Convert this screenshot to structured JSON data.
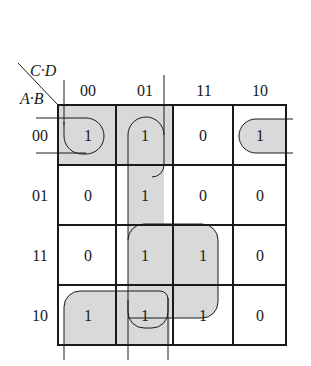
{
  "axis": {
    "column_variables": "C·D",
    "row_variables": "A·B"
  },
  "columns": [
    "00",
    "01",
    "11",
    "10"
  ],
  "rows": [
    "00",
    "01",
    "11",
    "10"
  ],
  "cells": [
    [
      "1",
      "1",
      "0",
      "1"
    ],
    [
      "0",
      "1",
      "0",
      "0"
    ],
    [
      "0",
      "1",
      "1",
      "0"
    ],
    [
      "1",
      "1",
      "1",
      "0"
    ]
  ],
  "groupings": [
    {
      "name": "row-00 wrap group",
      "cells": [
        [
          0,
          0
        ],
        [
          0,
          3
        ]
      ]
    },
    {
      "name": "column-01 group",
      "cells": [
        [
          0,
          1
        ],
        [
          1,
          1
        ],
        [
          2,
          1
        ],
        [
          3,
          1
        ]
      ]
    },
    {
      "name": "quad 11/10 x 01/11",
      "cells": [
        [
          2,
          1
        ],
        [
          2,
          2
        ],
        [
          3,
          1
        ],
        [
          3,
          2
        ]
      ]
    },
    {
      "name": "row-10 pair",
      "cells": [
        [
          3,
          0
        ],
        [
          3,
          1
        ]
      ]
    }
  ],
  "colors": {
    "shade": "#d9d9d9",
    "line": "#1a1a1a"
  }
}
